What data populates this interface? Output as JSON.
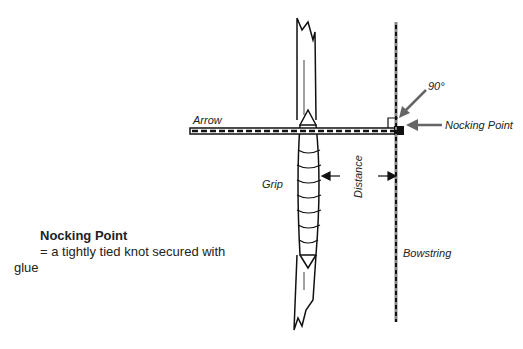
{
  "diagram": {
    "labels": {
      "arrow": "Arrow",
      "grip": "Grip",
      "distance": "Distance",
      "angle": "90°",
      "nocking_point": "Nocking Point",
      "bowstring": "Bowstring"
    },
    "caption": {
      "title": "Nocking Point",
      "definition": "= a tightly tied knot secured with glue"
    },
    "colors": {
      "ink": "#111111",
      "pointer_arrow": "#666666"
    }
  }
}
